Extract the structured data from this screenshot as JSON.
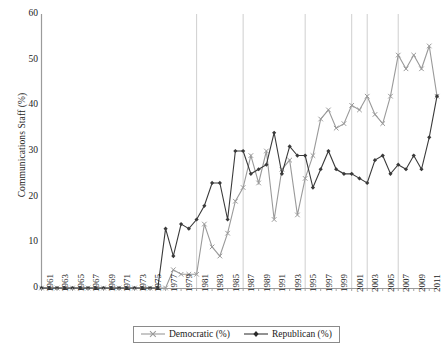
{
  "chart_data": {
    "type": "line",
    "title": "",
    "xlabel": "",
    "ylabel": "Communications Staff (%)",
    "ylim": [
      0,
      60
    ],
    "yticks": [
      0,
      10,
      20,
      30,
      40,
      50,
      60
    ],
    "xlim": [
      1961,
      2012
    ],
    "grid": "vertical-only",
    "gridlines_x": [
      1981,
      1987,
      1995,
      2001,
      2003,
      2007
    ],
    "legend_position": "bottom",
    "x": [
      1961,
      1962,
      1963,
      1964,
      1965,
      1966,
      1967,
      1968,
      1969,
      1970,
      1971,
      1972,
      1973,
      1974,
      1975,
      1976,
      1977,
      1978,
      1979,
      1980,
      1981,
      1982,
      1983,
      1984,
      1985,
      1986,
      1987,
      1988,
      1989,
      1990,
      1991,
      1992,
      1993,
      1994,
      1995,
      1996,
      1997,
      1998,
      1999,
      2000,
      2001,
      2002,
      2003,
      2004,
      2005,
      2006,
      2007,
      2008,
      2009,
      2010,
      2011,
      2012
    ],
    "xtick_labels": [
      "1961",
      "1963",
      "1965",
      "1967",
      "1969",
      "1971",
      "1973",
      "1975",
      "1977",
      "1979",
      "1981",
      "1983",
      "1985",
      "1987",
      "1989",
      "1991",
      "1993",
      "1995",
      "1997",
      "1999",
      "2001",
      "2003",
      "2005",
      "2007",
      "2009",
      "2011"
    ],
    "series": [
      {
        "name": "Democratic (%)",
        "color": "#9a9a9a",
        "marker": "x",
        "values": [
          0,
          0,
          0,
          0,
          0,
          0,
          0,
          0,
          0,
          0,
          0,
          0,
          0,
          0,
          0,
          0,
          0,
          4,
          3,
          3,
          3,
          14,
          9,
          7,
          12,
          19,
          22,
          29,
          23,
          30,
          15,
          26,
          28,
          16,
          24,
          29,
          37,
          39,
          35,
          36,
          40,
          39,
          42,
          38,
          36,
          42,
          51,
          48,
          51,
          48,
          53,
          42
        ]
      },
      {
        "name": "Republican (%)",
        "color": "#3a3a3a",
        "marker": "diamond",
        "values": [
          0,
          0,
          0,
          0,
          0,
          0,
          0,
          0,
          0,
          0,
          0,
          0,
          0,
          0,
          0,
          0,
          13,
          7,
          14,
          13,
          15,
          18,
          23,
          23,
          15,
          30,
          30,
          25,
          26,
          27,
          34,
          25,
          31,
          29,
          29,
          22,
          26,
          30,
          26,
          25,
          25,
          24,
          23,
          28,
          29,
          25,
          27,
          26,
          29,
          26,
          33,
          42
        ]
      }
    ]
  },
  "legend": {
    "entries": [
      {
        "label": "Democratic (%)"
      },
      {
        "label": "Republican (%)"
      }
    ]
  }
}
